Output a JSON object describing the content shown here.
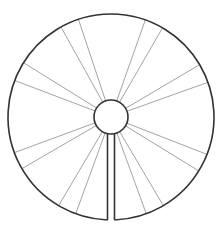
{
  "diagram": {
    "type": "radial-wheel",
    "center": [
      111,
      117
    ],
    "outer_radius": 103,
    "inner_radius": 17,
    "colors": {
      "outline": "#333333",
      "spoke": "#999999",
      "background": "#ffffff"
    },
    "slit": {
      "left_x": 107.5,
      "right_x": 114.5
    },
    "spokes": [
      [
        78,
        18
      ],
      [
        61,
        27
      ],
      [
        24,
        63
      ],
      [
        16,
        81
      ],
      [
        16,
        152
      ],
      [
        23,
        168
      ],
      [
        59,
        205
      ],
      [
        76,
        213
      ],
      [
        146,
        18
      ],
      [
        163,
        27
      ],
      [
        199,
        65
      ],
      [
        206,
        83
      ],
      [
        206,
        154
      ],
      [
        199,
        171
      ],
      [
        163,
        205
      ],
      [
        146,
        213
      ]
    ]
  }
}
